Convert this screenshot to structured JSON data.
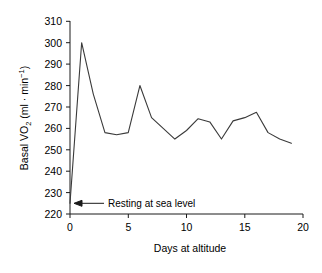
{
  "chart_data": {
    "type": "line",
    "title": "",
    "xlabel": "Days at altitude",
    "ylabel": "Basal VO2 (ml · min-1)",
    "ylabel_parts": {
      "prefix": "Basal VO",
      "subscript": "2",
      "units_open": " (ml · min",
      "superscript": "−1",
      "units_close": ")"
    },
    "xlim": [
      0,
      20
    ],
    "ylim": [
      220,
      310
    ],
    "xticks": [
      0,
      5,
      10,
      15,
      20
    ],
    "xtick_labels": [
      "0",
      "5",
      "10",
      "15",
      "20"
    ],
    "yticks": [
      220,
      230,
      240,
      250,
      260,
      270,
      280,
      290,
      300,
      310
    ],
    "ytick_labels": [
      "220",
      "230",
      "240",
      "250",
      "260",
      "270",
      "280",
      "290",
      "300",
      "310"
    ],
    "grid": false,
    "legend": false,
    "line_color": "#3a3a3a",
    "series": [
      {
        "name": "Basal VO2",
        "x": [
          0,
          1,
          2,
          3,
          4,
          5,
          6,
          7,
          8,
          9,
          10,
          11,
          12,
          13,
          14,
          15,
          16,
          17,
          18,
          19
        ],
        "values": [
          225,
          300,
          276,
          258,
          257,
          258,
          280,
          265,
          260,
          255,
          259,
          264.5,
          263,
          255,
          263.5,
          265,
          267.5,
          258,
          255,
          253
        ]
      }
    ],
    "annotations": [
      {
        "text": "Resting at sea level",
        "points_to_x": 0,
        "points_to_y": 225,
        "arrow": "left"
      }
    ]
  }
}
